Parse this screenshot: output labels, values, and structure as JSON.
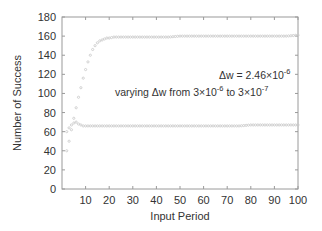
{
  "chart_data": {
    "type": "scatter",
    "title": "",
    "xlabel": "Input Period",
    "ylabel": "Number of Success",
    "xlim": [
      0,
      100
    ],
    "ylim": [
      0,
      180
    ],
    "xticks": [
      10,
      20,
      30,
      40,
      50,
      60,
      70,
      80,
      90,
      100
    ],
    "yticks": [
      0,
      20,
      40,
      60,
      80,
      100,
      120,
      140,
      160,
      180
    ],
    "grid": false,
    "legend": null,
    "annotations": [
      {
        "text_main": "Δw = 2.46×10",
        "sup": "-6",
        "x": 60,
        "y": 100
      },
      {
        "text_main": "varying Δw from 3×10",
        "sup1": "-6",
        "mid": " to 3×10",
        "sup2": "-7",
        "x": 55,
        "y": 90
      }
    ],
    "series": [
      {
        "name": "varying Δw",
        "color": "#c8c8c8",
        "x": [
          2,
          3,
          4,
          5,
          6,
          7,
          8,
          9,
          10,
          11,
          12,
          13,
          14,
          15,
          16,
          17,
          18,
          19,
          20,
          22,
          25,
          30,
          35,
          40,
          45,
          50,
          55,
          60,
          65,
          70,
          75,
          80,
          85,
          90,
          95,
          100
        ],
        "y": [
          40,
          50,
          62,
          74,
          85,
          96,
          106,
          116,
          125,
          133,
          140,
          146,
          150,
          153,
          155,
          156,
          157,
          158,
          158,
          159,
          159,
          159,
          159,
          159,
          159,
          160,
          160,
          160,
          160,
          160,
          160,
          160,
          160,
          160,
          160,
          161
        ]
      },
      {
        "name": "Δw = 2.46×10^-6",
        "color": "#c8c8c8",
        "x": [
          2,
          3,
          4,
          5,
          6,
          7,
          8,
          9,
          10,
          12,
          15,
          20,
          25,
          30,
          35,
          40,
          45,
          50,
          55,
          60,
          65,
          70,
          75,
          80,
          85,
          90,
          95,
          100
        ],
        "y": [
          60,
          64,
          67,
          69,
          70,
          68,
          67,
          66,
          66,
          66,
          66,
          66,
          66,
          66,
          66,
          66,
          66,
          66,
          66,
          66,
          66,
          66,
          66,
          67,
          67,
          67,
          67,
          67
        ]
      }
    ]
  }
}
